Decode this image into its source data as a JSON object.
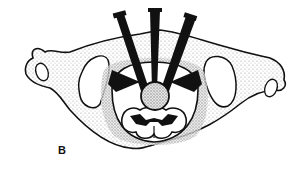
{
  "figure": {
    "panel_label": "B",
    "colors": {
      "ink": "#111111",
      "stipple": "#9a9a9a",
      "background": "#ffffff"
    }
  }
}
